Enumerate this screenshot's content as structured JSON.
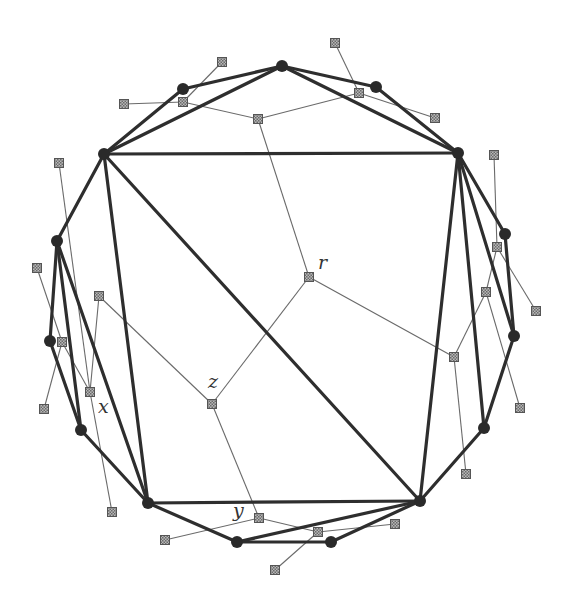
{
  "diagram": {
    "colors": {
      "heavy_edge": "#2e2e2e",
      "thin_edge": "#6a6a6a",
      "vertex": "#2a2a2a",
      "dual_node_fill": "#9a9a9a"
    },
    "vertices": [
      {
        "id": "A",
        "x": 104,
        "y": 154
      },
      {
        "id": "B",
        "x": 183,
        "y": 89
      },
      {
        "id": "C",
        "x": 282,
        "y": 66
      },
      {
        "id": "D",
        "x": 376,
        "y": 87
      },
      {
        "id": "E",
        "x": 458,
        "y": 153
      },
      {
        "id": "F",
        "x": 505,
        "y": 234
      },
      {
        "id": "G",
        "x": 514,
        "y": 336
      },
      {
        "id": "H",
        "x": 484,
        "y": 428
      },
      {
        "id": "I",
        "x": 420,
        "y": 501
      },
      {
        "id": "J",
        "x": 331,
        "y": 542
      },
      {
        "id": "K",
        "x": 237,
        "y": 542
      },
      {
        "id": "L",
        "x": 148,
        "y": 503
      },
      {
        "id": "M",
        "x": 81,
        "y": 430
      },
      {
        "id": "N",
        "x": 50,
        "y": 341
      },
      {
        "id": "O",
        "x": 57,
        "y": 241
      }
    ],
    "heavy_edges": [
      [
        "A",
        "B"
      ],
      [
        "B",
        "C"
      ],
      [
        "C",
        "D"
      ],
      [
        "D",
        "E"
      ],
      [
        "E",
        "F"
      ],
      [
        "F",
        "G"
      ],
      [
        "G",
        "H"
      ],
      [
        "H",
        "I"
      ],
      [
        "I",
        "J"
      ],
      [
        "J",
        "K"
      ],
      [
        "K",
        "L"
      ],
      [
        "L",
        "M"
      ],
      [
        "M",
        "N"
      ],
      [
        "N",
        "O"
      ],
      [
        "O",
        "A"
      ],
      [
        "A",
        "C"
      ],
      [
        "C",
        "E"
      ],
      [
        "A",
        "E"
      ],
      [
        "A",
        "L"
      ],
      [
        "A",
        "I"
      ],
      [
        "L",
        "I"
      ],
      [
        "E",
        "I"
      ],
      [
        "E",
        "H"
      ],
      [
        "E",
        "G"
      ],
      [
        "O",
        "M"
      ],
      [
        "O",
        "L"
      ],
      [
        "I",
        "K"
      ]
    ],
    "dual_nodes": [
      {
        "id": "r",
        "x": 309,
        "y": 277,
        "label": "r"
      },
      {
        "id": "z",
        "x": 212,
        "y": 404,
        "label": "z"
      },
      {
        "id": "y",
        "x": 259,
        "y": 518,
        "label": "y"
      },
      {
        "id": "s1",
        "x": 258,
        "y": 119
      },
      {
        "id": "s2",
        "x": 183,
        "y": 102
      },
      {
        "id": "s3",
        "x": 359,
        "y": 93
      },
      {
        "id": "s4",
        "x": 124,
        "y": 104
      },
      {
        "id": "s5",
        "x": 222,
        "y": 62
      },
      {
        "id": "s6",
        "x": 335,
        "y": 43
      },
      {
        "id": "s7",
        "x": 435,
        "y": 118
      },
      {
        "id": "s8",
        "x": 454,
        "y": 357
      },
      {
        "id": "s9",
        "x": 486,
        "y": 292
      },
      {
        "id": "s10",
        "x": 497,
        "y": 247
      },
      {
        "id": "s11",
        "x": 494,
        "y": 155
      },
      {
        "id": "s12",
        "x": 536,
        "y": 311
      },
      {
        "id": "s13",
        "x": 520,
        "y": 408
      },
      {
        "id": "s14",
        "x": 466,
        "y": 474
      },
      {
        "id": "s15",
        "x": 99,
        "y": 296
      },
      {
        "id": "s16",
        "x": 90,
        "y": 392
      },
      {
        "id": "s17",
        "x": 62,
        "y": 342
      },
      {
        "id": "s18",
        "x": 37,
        "y": 268
      },
      {
        "id": "s19",
        "x": 44,
        "y": 409
      },
      {
        "id": "s20",
        "x": 59,
        "y": 163
      },
      {
        "id": "s21",
        "x": 112,
        "y": 512
      },
      {
        "id": "s22",
        "x": 165,
        "y": 540
      },
      {
        "id": "s23",
        "x": 318,
        "y": 532
      },
      {
        "id": "s24",
        "x": 395,
        "y": 524
      },
      {
        "id": "s25",
        "x": 275,
        "y": 570
      }
    ],
    "thin_edges": [
      [
        "r",
        "s1"
      ],
      [
        "s1",
        "s2"
      ],
      [
        "s1",
        "s3"
      ],
      [
        "s2",
        "s4"
      ],
      [
        "s2",
        "s5"
      ],
      [
        "s3",
        "s6"
      ],
      [
        "s3",
        "s7"
      ],
      [
        "r",
        "s8"
      ],
      [
        "s8",
        "s9"
      ],
      [
        "s9",
        "s10"
      ],
      [
        "s10",
        "s11"
      ],
      [
        "s10",
        "s12"
      ],
      [
        "s9",
        "s13"
      ],
      [
        "s8",
        "s14"
      ],
      [
        "r",
        "z"
      ],
      [
        "z",
        "s15"
      ],
      [
        "s15",
        "s16"
      ],
      [
        "s16",
        "s17"
      ],
      [
        "s17",
        "s18"
      ],
      [
        "s17",
        "s19"
      ],
      [
        "s16",
        "s20"
      ],
      [
        "s16",
        "s21"
      ],
      [
        "z",
        "y"
      ],
      [
        "y",
        "s22"
      ],
      [
        "y",
        "s23"
      ],
      [
        "s23",
        "s24"
      ],
      [
        "s23",
        "s25"
      ]
    ],
    "labels": [
      {
        "text": "r",
        "x": 318,
        "y": 269
      },
      {
        "text": "z",
        "x": 208,
        "y": 388
      },
      {
        "text": "x",
        "x": 98,
        "y": 413
      },
      {
        "text": "y",
        "x": 233,
        "y": 517
      }
    ]
  }
}
